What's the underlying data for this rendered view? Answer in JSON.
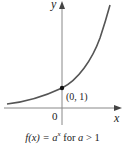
{
  "diagram": {
    "type": "function-graph",
    "axes": {
      "x_label": "x",
      "y_label": "y",
      "origin_label": "0"
    },
    "point": {
      "label": "(0, 1)",
      "x": 0,
      "y": 1
    },
    "curve": {
      "function": "a^x",
      "condition": "a > 1",
      "color": "#555555"
    },
    "caption": {
      "prefix": "f(x) = ",
      "base": "a",
      "exponent": "x",
      "suffix_for": " for ",
      "var": "a",
      "suffix_cond": " > 1"
    }
  }
}
